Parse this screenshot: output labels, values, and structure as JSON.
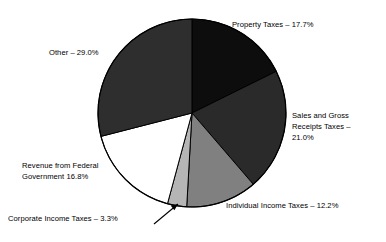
{
  "chart_data": {
    "type": "pie",
    "title": "",
    "subtitle": "",
    "xlabel": "",
    "ylabel": "",
    "legend_position": "none",
    "grid": false,
    "units": "percent",
    "total": 100.0,
    "start_angle_deg": 0,
    "direction": "clockwise",
    "categories": [
      "Property Taxes",
      "Sales and Gross Receipts Taxes",
      "Individual Income Taxes",
      "Corporate Income Taxes",
      "Revenue from Federal Government",
      "Other"
    ],
    "values": [
      17.7,
      21.0,
      12.2,
      3.3,
      16.8,
      29.0
    ],
    "slices": [
      {
        "name": "Property Taxes",
        "value": 17.7,
        "color": "#0d0d0d",
        "label_text": "Property Taxes – 17.7%",
        "has_leader_line": false
      },
      {
        "name": "Sales and Gross Receipts Taxes",
        "value": 21.0,
        "color": "#2a2a2a",
        "label_line_1": "Sales and Gross",
        "label_line_2": "Receipts Taxes –",
        "label_line_3": "21.0%",
        "has_leader_line": false
      },
      {
        "name": "Individual Income Taxes",
        "value": 12.2,
        "color": "#808080",
        "label_text": "Individual Income Taxes – 12.2%",
        "has_leader_line": false
      },
      {
        "name": "Corporate Income Taxes",
        "value": 3.3,
        "color": "#b5b5b5",
        "label_text": "Corporate Income Taxes – 3.3%",
        "has_leader_line": true
      },
      {
        "name": "Revenue from Federal Government",
        "value": 16.8,
        "color": "#ffffff",
        "label_line_1": "Revenue from Federal",
        "label_line_2": "Government 16.8%",
        "has_leader_line": false
      },
      {
        "name": "Other",
        "value": 29.0,
        "color": "#2e2e2e",
        "label_text": "Other – 29.0%",
        "has_leader_line": false
      }
    ]
  },
  "labels": {
    "property": "Property Taxes – 17.7%",
    "sales_line_1": "Sales and Gross",
    "sales_line_2": "Receipts Taxes –",
    "sales_line_3": "21.0%",
    "individual": "Individual Income Taxes – 12.2%",
    "corporate": "Corporate Income Taxes – 3.3%",
    "federal_line_1": "Revenue from Federal",
    "federal_line_2": "Government 16.8%",
    "other": "Other – 29.0%"
  },
  "style": {
    "outline_color": "#000000",
    "background": "#ffffff"
  }
}
